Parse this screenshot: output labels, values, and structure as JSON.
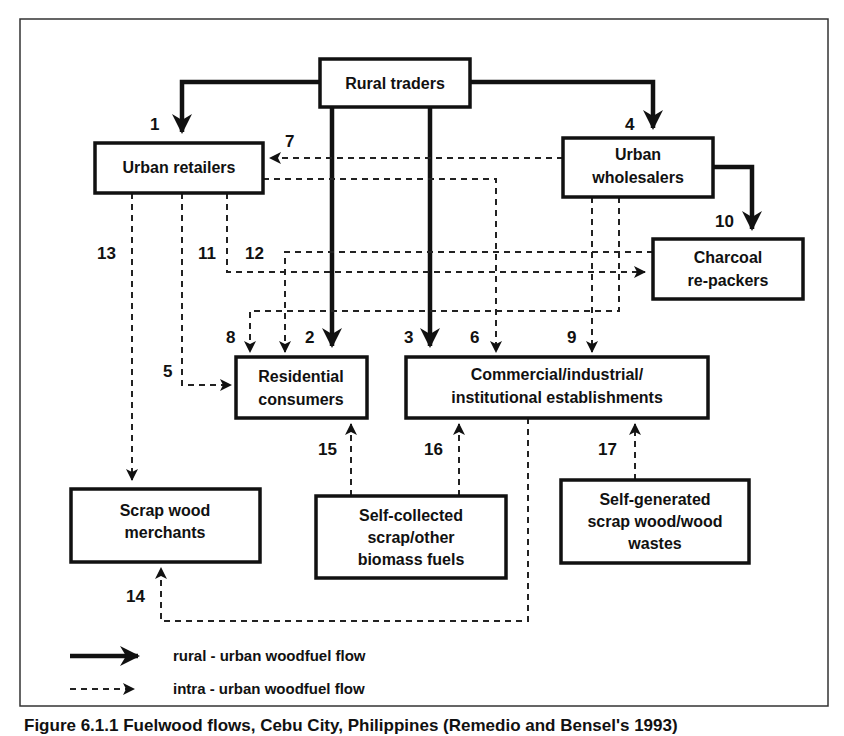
{
  "nodes": {
    "rural_traders": {
      "lines": [
        "Rural traders"
      ]
    },
    "urban_retailers": {
      "lines": [
        "Urban retailers"
      ]
    },
    "urban_wholesalers": {
      "lines": [
        "Urban",
        "wholesalers"
      ]
    },
    "charcoal_repackers": {
      "lines": [
        "Charcoal",
        "re-packers"
      ]
    },
    "residential_consumers": {
      "lines": [
        "Residential",
        "consumers"
      ]
    },
    "commercial": {
      "lines": [
        "Commercial/industrial/",
        "institutional establishments"
      ]
    },
    "scrap_wood_merchants": {
      "lines": [
        "Scrap wood",
        "merchants"
      ]
    },
    "self_collected": {
      "lines": [
        "Self-collected",
        "scrap/other",
        "biomass fuels"
      ]
    },
    "self_generated": {
      "lines": [
        "Self-generated",
        "scrap wood/wood",
        "wastes"
      ]
    }
  },
  "flows": [
    {
      "id": "1",
      "from": "Rural traders",
      "to": "Urban retailers",
      "type": "rural-urban"
    },
    {
      "id": "2",
      "from": "Rural traders",
      "to": "Residential consumers",
      "type": "rural-urban"
    },
    {
      "id": "3",
      "from": "Rural traders",
      "to": "Commercial/industrial/institutional establishments",
      "type": "rural-urban"
    },
    {
      "id": "4",
      "from": "Rural traders",
      "to": "Urban wholesalers",
      "type": "rural-urban"
    },
    {
      "id": "5",
      "from": "Urban retailers",
      "to": "Residential consumers",
      "type": "intra-urban"
    },
    {
      "id": "6",
      "from": "Urban retailers",
      "to": "Commercial/industrial/institutional establishments",
      "type": "intra-urban"
    },
    {
      "id": "7",
      "from": "Urban wholesalers",
      "to": "Urban retailers",
      "type": "intra-urban"
    },
    {
      "id": "8",
      "from": "Urban wholesalers",
      "to": "Residential consumers",
      "type": "intra-urban"
    },
    {
      "id": "9",
      "from": "Urban wholesalers",
      "to": "Commercial/industrial/institutional establishments",
      "type": "intra-urban"
    },
    {
      "id": "10",
      "from": "Urban wholesalers",
      "to": "Charcoal re-packers",
      "type": "rural-urban"
    },
    {
      "id": "11",
      "from": "Urban retailers",
      "to": "Charcoal re-packers",
      "type": "intra-urban"
    },
    {
      "id": "12",
      "from": "Charcoal re-packers",
      "to": "Residential consumers",
      "type": "intra-urban"
    },
    {
      "id": "13",
      "from": "Urban retailers",
      "to": "Scrap wood merchants",
      "type": "intra-urban"
    },
    {
      "id": "14",
      "from": "Commercial/industrial/institutional establishments",
      "to": "Scrap wood merchants",
      "type": "intra-urban"
    },
    {
      "id": "15",
      "from": "Self-collected scrap/other biomass fuels",
      "to": "Residential consumers",
      "type": "intra-urban"
    },
    {
      "id": "16",
      "from": "Self-collected scrap/other biomass fuels",
      "to": "Commercial/industrial/institutional establishments",
      "type": "intra-urban"
    },
    {
      "id": "17",
      "from": "Self-generated scrap wood/wood wastes",
      "to": "Commercial/industrial/institutional establishments",
      "type": "intra-urban"
    }
  ],
  "legend": {
    "solid": "rural - urban woodfuel flow",
    "dashed": "intra - urban woodfuel flow"
  },
  "caption": "Figure 6.1.1 Fuelwood flows, Cebu City, Philippines (Remedio and Bensel's 1993)",
  "colors": {
    "ink": "#111111",
    "background": "#ffffff"
  }
}
